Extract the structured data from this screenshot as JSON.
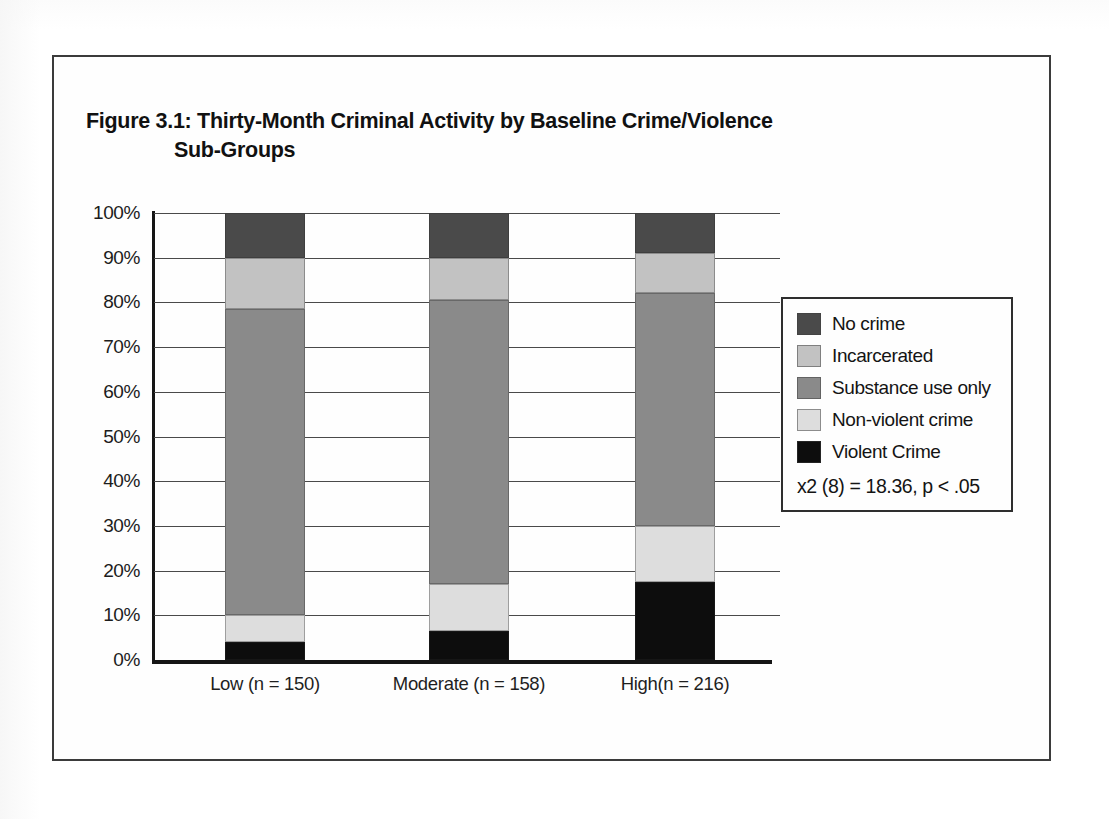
{
  "figure": {
    "title_line1": "Figure 3.1: Thirty-Month Criminal Activity by Baseline Crime/Violence",
    "title_line2": "Sub-Groups"
  },
  "legend": {
    "position": "right",
    "items": [
      {
        "label": "No crime",
        "color": "#4a4a4a",
        "swatch_name": "legend-swatch-no-crime"
      },
      {
        "label": "Incarcerated",
        "color": "#c2c2c2",
        "swatch_name": "legend-swatch-incarcerated"
      },
      {
        "label": "Substance use only",
        "color": "#8a8a8a",
        "swatch_name": "legend-swatch-substance-use-only"
      },
      {
        "label": "Non-violent crime",
        "color": "#dddddd",
        "swatch_name": "legend-swatch-non-violent-crime"
      },
      {
        "label": "Violent Crime",
        "color": "#0d0d0d",
        "swatch_name": "legend-swatch-violent-crime"
      }
    ],
    "statistic": "x2 (8) = 18.36, p < .05"
  },
  "axis": {
    "y_ticks": [
      "100%",
      "90%",
      "80%",
      "70%",
      "60%",
      "50%",
      "40%",
      "30%",
      "20%",
      "10%",
      "0%"
    ],
    "y_tick_values": [
      100,
      90,
      80,
      70,
      60,
      50,
      40,
      30,
      20,
      10,
      0
    ]
  },
  "chart_data": {
    "type": "bar",
    "stacked": true,
    "stack_percent": true,
    "title": "Figure 3.1: Thirty-Month Criminal Activity by Baseline Crime/Violence Sub-Groups",
    "subtitle": "",
    "xlabel": "",
    "ylabel": "",
    "ylim": [
      0,
      100
    ],
    "ytick_step": 10,
    "grid": true,
    "legend_position": "right",
    "annotations": [
      "x2 (8) = 18.36, p < .05"
    ],
    "categories": [
      "Low (n = 150)",
      "Moderate (n = 158)",
      "High(n = 216)"
    ],
    "category_n": [
      150,
      158,
      216
    ],
    "series": [
      {
        "name": "Violent Crime",
        "color": "#0d0d0d",
        "values": [
          4.0,
          6.5,
          17.5
        ]
      },
      {
        "name": "Non-violent crime",
        "color": "#dddddd",
        "values": [
          6.0,
          10.5,
          12.5
        ]
      },
      {
        "name": "Substance use only",
        "color": "#8a8a8a",
        "values": [
          68.5,
          63.5,
          52.0
        ]
      },
      {
        "name": "Incarcerated",
        "color": "#c2c2c2",
        "values": [
          11.5,
          9.5,
          9.0
        ]
      },
      {
        "name": "No crime",
        "color": "#4a4a4a",
        "values": [
          10.0,
          10.0,
          9.0
        ]
      }
    ],
    "stack_order_bottom_to_top": [
      "Violent Crime",
      "Non-violent crime",
      "Substance use only",
      "Incarcerated",
      "No crime"
    ]
  }
}
